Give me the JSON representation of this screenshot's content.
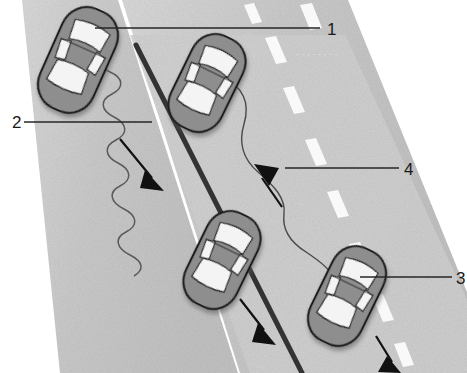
{
  "figure": {
    "width": 467,
    "height": 373,
    "background_color": "#ffffff"
  },
  "colors": {
    "asphalt_light": "#d4d4d4",
    "asphalt_dark": "#b8b8b8",
    "lane_marking": "#fdfdfd",
    "center_line": "#333333",
    "car_body": "#8e8e8e",
    "car_outline": "#1d1d1d",
    "car_window": "#f4f4f4",
    "leader_line": "#262626",
    "label_text": "#1a1a1a",
    "arrow": "#111111",
    "path_line": "#5a5a5a"
  },
  "callouts": [
    {
      "id": "callout-1",
      "label": "1",
      "label_x": 327,
      "label_y": 29,
      "points_to": "top-left-car",
      "description": "Leader line from right edge to the upper-left vehicle"
    },
    {
      "id": "callout-2",
      "label": "2",
      "label_x": 16,
      "label_y": 128,
      "points_to": "weaving-path",
      "description": "Leader line from left edge to the serpentine weaving path"
    },
    {
      "id": "callout-3",
      "label": "3",
      "label_x": 459,
      "label_y": 282,
      "points_to": "bottom-right-car",
      "description": "Leader line from right edge to the lower-right vehicle"
    },
    {
      "id": "callout-4",
      "label": "4",
      "label_x": 406,
      "label_y": 174,
      "points_to": "smooth-path",
      "description": "Leader line from right edge to the gently curving path"
    }
  ],
  "road": {
    "name": "two-way-roadway",
    "orientation": "diagonal, descending from upper-left to lower-right",
    "lanes": [
      {
        "name": "left-lane",
        "direction": "downward"
      },
      {
        "name": "right-lane",
        "direction": "upward-and-downward"
      }
    ],
    "center_line": {
      "name": "center-divider-line",
      "style": "solid dark"
    },
    "lane_markings": {
      "name": "dashed-lane-markings",
      "style": "white dashes",
      "count": 9
    }
  },
  "cars": [
    {
      "id": "top-left-car",
      "position": "upper-left",
      "lane": "left-lane"
    },
    {
      "id": "top-middle-car",
      "position": "upper-middle",
      "lane": "right-lane"
    },
    {
      "id": "bottom-middle-car",
      "position": "lower-middle",
      "lane": "left-lane"
    },
    {
      "id": "bottom-right-car",
      "position": "lower-right",
      "lane": "right-lane"
    }
  ],
  "paths": [
    {
      "id": "weaving-path",
      "style": "tight serpentine / zig-zag",
      "meaning": "erratic weaving trajectory",
      "callout": "2"
    },
    {
      "id": "smooth-path",
      "style": "gentle sinusoidal curve",
      "meaning": "smooth lane-change trajectory",
      "callout": "4"
    }
  ],
  "direction_arrows": [
    {
      "id": "arrow-left-lane-down",
      "direction": "down-right"
    },
    {
      "id": "arrow-right-lane-up",
      "direction": "up-left"
    },
    {
      "id": "arrow-mid-lane-down",
      "direction": "down-right"
    },
    {
      "id": "arrow-far-right-down",
      "direction": "down-right"
    }
  ],
  "artifacts": {
    "faint_scan_text": "· · · · · · · ·"
  }
}
